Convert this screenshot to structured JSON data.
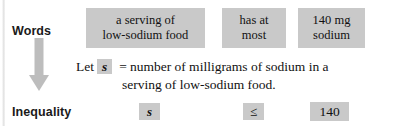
{
  "diagram": {
    "rows": {
      "words_label": "Words",
      "inequality_label": "Inequality"
    },
    "arrow": {
      "icon": "down-arrow-icon",
      "color": "#bdbdbd",
      "direction": "down"
    },
    "words_row": {
      "subject": {
        "line1": "a serving of",
        "line2": "low-sodium food"
      },
      "relation": {
        "line1": "has at",
        "line2": "most"
      },
      "value": {
        "line1": "140 mg",
        "line2": "sodium"
      }
    },
    "definition": {
      "lead": "Let",
      "variable": "s",
      "equals": "=",
      "line1_text": "number of milligrams of sodium in a",
      "line2_text": "serving of low-sodium food."
    },
    "inequality_row": {
      "variable": "s",
      "operator": "≤",
      "constant": "140"
    },
    "colors": {
      "chip_background": "#c9c9c9",
      "text": "#111111",
      "arrow": "#bdbdbd",
      "page_background": "#ffffff"
    }
  }
}
